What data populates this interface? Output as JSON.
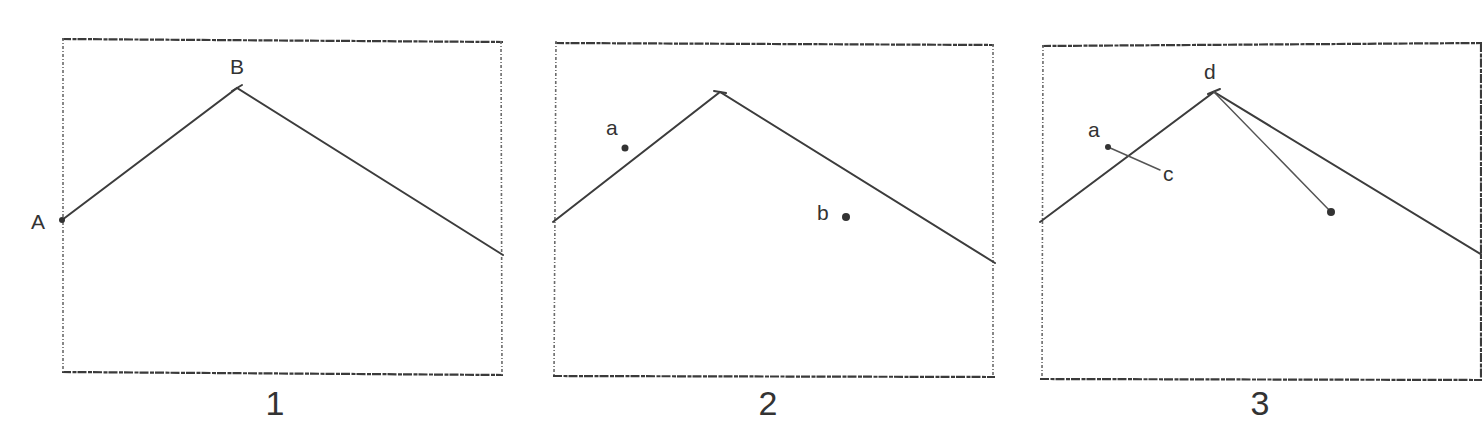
{
  "panels": [
    {
      "number": "1",
      "points": {
        "A": "A",
        "B": "B"
      }
    },
    {
      "number": "2",
      "points": {
        "a": "a",
        "b": "b"
      }
    },
    {
      "number": "3",
      "points": {
        "a": "a",
        "c": "c",
        "d": "d"
      }
    }
  ],
  "colors": {
    "ink": "#333333",
    "paper": "#ffffff"
  }
}
